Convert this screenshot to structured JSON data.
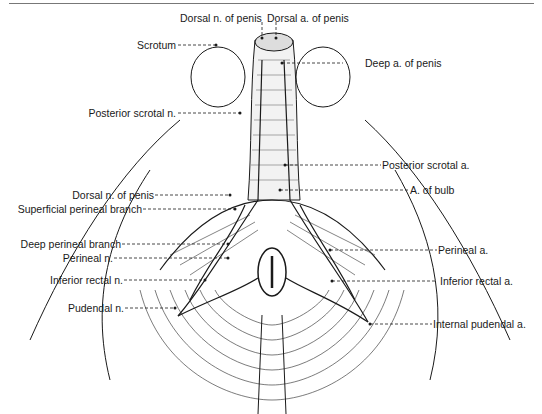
{
  "figure": {
    "labels_top": [
      {
        "id": "dorsal-n-penis-top",
        "text": "Dorsal n. of penis"
      },
      {
        "id": "dorsal-a-penis-top",
        "text": "Dorsal a. of penis"
      }
    ],
    "labels_left": [
      {
        "id": "scrotum",
        "text": "Scrotum"
      },
      {
        "id": "posterior-scrotal-n",
        "text": "Posterior scrotal n."
      },
      {
        "id": "dorsal-n-penis",
        "text": "Dorsal n. of penis"
      },
      {
        "id": "superficial-perineal-branch",
        "text": "Superficial perineal branch"
      },
      {
        "id": "deep-perineal-branch",
        "text": "Deep perineal branch"
      },
      {
        "id": "perineal-n",
        "text": "Perineal n."
      },
      {
        "id": "inferior-rectal-n",
        "text": "Inferior rectal n."
      },
      {
        "id": "pudendal-n",
        "text": "Pudendal n."
      }
    ],
    "labels_right": [
      {
        "id": "deep-a-penis",
        "text": "Deep a. of penis"
      },
      {
        "id": "posterior-scrotal-a",
        "text": "Posterior scrotal a."
      },
      {
        "id": "a-of-bulb",
        "text": "A. of bulb"
      },
      {
        "id": "perineal-a",
        "text": "Perineal a."
      },
      {
        "id": "inferior-rectal-a",
        "text": "Inferior rectal a."
      },
      {
        "id": "internal-pudendal-a",
        "text": "Internal pudendal a."
      }
    ],
    "colors": {
      "ink": "#1a1a1a",
      "background": "#ffffff",
      "rule": "#777777"
    }
  }
}
